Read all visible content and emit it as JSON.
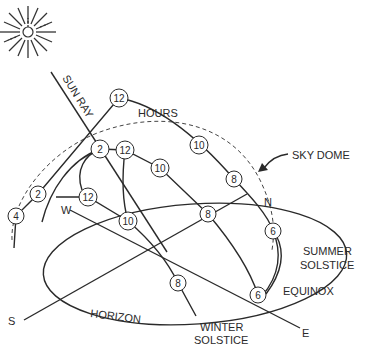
{
  "diagram": {
    "labels": {
      "sun_ray": "SUN RAY",
      "hours": "HOURS",
      "sky_dome": "SKY DOME",
      "summer_solstice_line1": "SUMMER",
      "summer_solstice_line2": "SOLSTICE",
      "equinox": "EQUINOX",
      "winter_solstice_line1": "WINTER",
      "winter_solstice_line2": "SOLSTICE",
      "horizon": "HORIZON"
    },
    "compass": {
      "north": "N",
      "south": "S",
      "east": "E",
      "west": "W"
    },
    "paths": {
      "summer_solstice": {
        "hours": [
          {
            "label": "4",
            "x": 16,
            "y": 216
          },
          {
            "label": "2",
            "x": 38,
            "y": 194
          },
          {
            "label": "12",
            "x": 119,
            "y": 98
          },
          {
            "label": "10",
            "x": 199,
            "y": 145
          },
          {
            "label": "8",
            "x": 234,
            "y": 179
          },
          {
            "label": "6",
            "x": 273,
            "y": 231
          }
        ]
      },
      "equinox": {
        "hours": [
          {
            "label": "2",
            "x": 100,
            "y": 149
          },
          {
            "label": "12",
            "x": 125,
            "y": 150
          },
          {
            "label": "10",
            "x": 160,
            "y": 168
          },
          {
            "label": "8",
            "x": 208,
            "y": 214
          },
          {
            "label": "6",
            "x": 258,
            "y": 295
          }
        ]
      },
      "winter_solstice": {
        "hours": [
          {
            "label": "12",
            "x": 88,
            "y": 197
          },
          {
            "label": "10",
            "x": 128,
            "y": 221
          },
          {
            "label": "8",
            "x": 178,
            "y": 283
          }
        ]
      }
    }
  }
}
